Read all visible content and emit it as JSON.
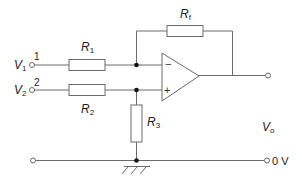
{
  "diagram": {
    "type": "differential amplifier (op-amp) schematic",
    "inputs": [
      {
        "name": "V",
        "sub": "1",
        "terminal_number": "1"
      },
      {
        "name": "V",
        "sub": "2",
        "terminal_number": "2"
      }
    ],
    "resistors": [
      {
        "id": "R1",
        "name": "R",
        "sub": "1"
      },
      {
        "id": "R2",
        "name": "R",
        "sub": "2"
      },
      {
        "id": "R3",
        "name": "R",
        "sub": "3"
      },
      {
        "id": "Rf",
        "name": "R",
        "sub": "f"
      }
    ],
    "opamp": {
      "inverting_sign": "−",
      "noninverting_sign": "+"
    },
    "output": {
      "name": "V",
      "sub": "o"
    },
    "ground": {
      "label": "0 V"
    }
  }
}
